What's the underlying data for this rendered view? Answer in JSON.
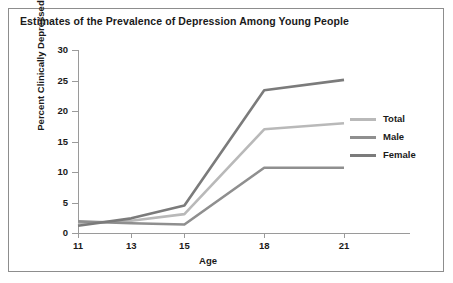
{
  "chart_data": {
    "type": "line",
    "title": "Estimates of the Prevalence of Depression Among Young People",
    "xlabel": "Age",
    "ylabel": "Percent Clinically Depressed",
    "x": [
      11,
      13,
      15,
      18,
      21
    ],
    "xticklabels": [
      "11",
      "13",
      "15",
      "18",
      "21"
    ],
    "yticklabels": [
      "0",
      "5",
      "10",
      "15",
      "20",
      "25",
      "30"
    ],
    "yticks": [
      0,
      5,
      10,
      15,
      20,
      25,
      30
    ],
    "ylim": [
      0,
      30
    ],
    "xlim": [
      11,
      21
    ],
    "grid": false,
    "legend_position": "right",
    "series": [
      {
        "name": "Total",
        "color": "#b9b9b9",
        "values": [
          1.6,
          2.0,
          3.1,
          17.0,
          18.0
        ]
      },
      {
        "name": "Male",
        "color": "#8f8f8f",
        "values": [
          1.9,
          1.6,
          1.4,
          10.7,
          10.7
        ]
      },
      {
        "name": "Female",
        "color": "#7b7b7b",
        "values": [
          1.2,
          2.4,
          4.5,
          23.4,
          25.1
        ]
      }
    ]
  },
  "legend": {
    "items": [
      {
        "label": "Total"
      },
      {
        "label": "Male"
      },
      {
        "label": "Female"
      }
    ]
  },
  "colors": {
    "frame": "#8d8d8d",
    "axis": "#9a9a9a",
    "text": "#1a1a1a",
    "background": "#ffffff"
  }
}
